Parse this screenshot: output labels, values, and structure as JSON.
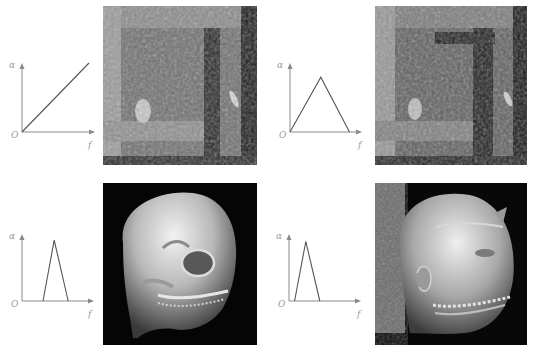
{
  "figure": {
    "panels": [
      {
        "id": "a",
        "transfer_function": {
          "type": "ramp",
          "y_axis_label": "α",
          "x_axis_label": "f",
          "origin_label": "O",
          "points": [
            [
              0,
              0
            ],
            [
              1,
              1
            ]
          ]
        },
        "rendering": {
          "subject": "wood-block-texture",
          "description": "Volume rendering with linear opacity ramp"
        }
      },
      {
        "id": "b",
        "transfer_function": {
          "type": "triangle",
          "y_axis_label": "α",
          "x_axis_label": "f",
          "origin_label": "O",
          "points": [
            [
              0,
              0
            ],
            [
              0.44,
              0.83
            ],
            [
              0.85,
              0
            ]
          ]
        },
        "rendering": {
          "subject": "wood-block-texture",
          "description": "Volume rendering with wide triangular transfer function"
        }
      },
      {
        "id": "c",
        "transfer_function": {
          "type": "narrow-triangle",
          "y_axis_label": "α",
          "x_axis_label": "f",
          "origin_label": "O",
          "points": [
            [
              0.3,
              0
            ],
            [
              0.46,
              0.95
            ],
            [
              0.66,
              0
            ]
          ]
        },
        "rendering": {
          "subject": "skull",
          "description": "Volume rendering showing skull bone"
        }
      },
      {
        "id": "d",
        "transfer_function": {
          "type": "narrow-triangle",
          "y_axis_label": "α",
          "x_axis_label": "f",
          "origin_label": "O",
          "points": [
            [
              0.08,
              0
            ],
            [
              0.24,
              0.93
            ],
            [
              0.44,
              0
            ]
          ]
        },
        "rendering": {
          "subject": "head-skin",
          "description": "Volume rendering showing head skin surface"
        }
      }
    ]
  }
}
